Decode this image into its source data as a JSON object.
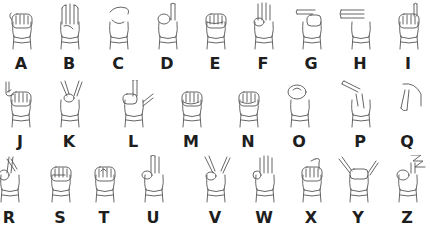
{
  "rows": [
    {
      "letters": [
        {
          "letter": "A",
          "x": 21,
          "shape": "fist-thumb-side"
        },
        {
          "letter": "B",
          "x": 69,
          "shape": "flat-hand-thumb-in"
        },
        {
          "letter": "C",
          "x": 118,
          "shape": "curved-c"
        },
        {
          "letter": "D",
          "x": 167,
          "shape": "index-up"
        },
        {
          "letter": "E",
          "x": 215,
          "shape": "fingers-curled"
        },
        {
          "letter": "F",
          "x": 263,
          "shape": "three-up-ok"
        },
        {
          "letter": "G",
          "x": 311,
          "shape": "index-sideways"
        },
        {
          "letter": "H",
          "x": 360,
          "shape": "two-sideways"
        },
        {
          "letter": "I",
          "x": 408,
          "shape": "pinky-up"
        }
      ],
      "hand_top": 2,
      "letter_top": 56
    },
    {
      "letters": [
        {
          "letter": "J",
          "x": 20,
          "shape": "pinky-hook"
        },
        {
          "letter": "K",
          "x": 69,
          "shape": "two-up-v-thumb"
        },
        {
          "letter": "L",
          "x": 133,
          "shape": "l-shape"
        },
        {
          "letter": "M",
          "x": 191,
          "shape": "fist-three-over"
        },
        {
          "letter": "N",
          "x": 248,
          "shape": "fist-two-over"
        },
        {
          "letter": "O",
          "x": 299,
          "shape": "o-shape"
        },
        {
          "letter": "P",
          "x": 360,
          "shape": "down-index"
        },
        {
          "letter": "Q",
          "x": 407,
          "shape": "down-thumb-index"
        }
      ],
      "hand_top": 80,
      "letter_top": 134
    },
    {
      "letters": [
        {
          "letter": "R",
          "x": 9,
          "shape": "crossed-fingers"
        },
        {
          "letter": "S",
          "x": 60,
          "shape": "fist-thumb-front"
        },
        {
          "letter": "T",
          "x": 104,
          "shape": "fist-thumb-between"
        },
        {
          "letter": "U",
          "x": 153,
          "shape": "two-up-together"
        },
        {
          "letter": "V",
          "x": 215,
          "shape": "two-up-v"
        },
        {
          "letter": "W",
          "x": 264,
          "shape": "three-up"
        },
        {
          "letter": "X",
          "x": 311,
          "shape": "hooked-index"
        },
        {
          "letter": "Y",
          "x": 358,
          "shape": "thumb-pinky-out"
        },
        {
          "letter": "Z",
          "x": 407,
          "shape": "index-zigzag"
        }
      ],
      "hand_top": 155,
      "letter_top": 210
    }
  ]
}
